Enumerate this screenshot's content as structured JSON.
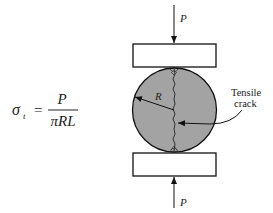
{
  "diagram": {
    "formula": {
      "lhs_symbol": "σ",
      "lhs_subscript": "t",
      "equals": "=",
      "numerator": "P",
      "denominator": "πRL"
    },
    "load_top_label": "P",
    "load_bottom_label": "P",
    "radius_label": "R",
    "crack_label_line1": "Tensile",
    "crack_label_line2": "crack",
    "colors": {
      "specimen_fill": "#a3a3a3",
      "stroke": "#111111",
      "plate_fill": "#ffffff"
    }
  }
}
